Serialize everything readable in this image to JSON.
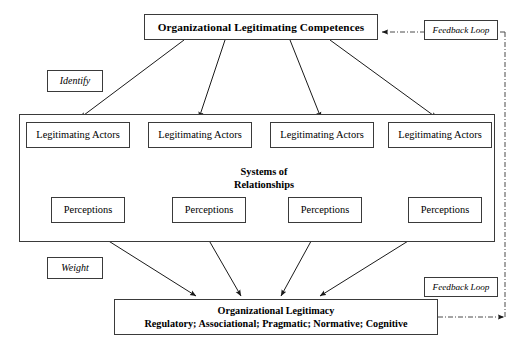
{
  "diagram": {
    "top_node": {
      "label": "Organizational Legitimating Competences"
    },
    "side_labels": {
      "identify": "Identify",
      "weight": "Weight"
    },
    "feedback_loops": {
      "top": "Feedback Loop",
      "bottom": "Feedback Loop"
    },
    "systems_container": {
      "label_line1": "Systems of",
      "label_line2": "Relationships"
    },
    "actors": [
      {
        "label": "Legitimating Actors"
      },
      {
        "label": "Legitimating Actors"
      },
      {
        "label": "Legitimating Actors"
      },
      {
        "label": "Legitimating Actors"
      }
    ],
    "perceptions": [
      {
        "label": "Perceptions"
      },
      {
        "label": "Perceptions"
      },
      {
        "label": "Perceptions"
      },
      {
        "label": "Perceptions"
      }
    ],
    "bottom_node": {
      "line1": "Organizational Legitimacy",
      "line2": "Regulatory; Associational; Pragmatic; Normative; Cognitive"
    },
    "colors": {
      "stroke": "#3a3a3a",
      "arrow": "#1a1a1a",
      "background": "#ffffff",
      "text": "#000000"
    }
  }
}
